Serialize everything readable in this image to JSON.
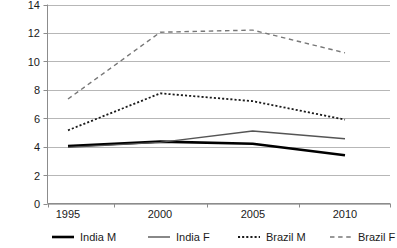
{
  "chart_data": {
    "type": "line",
    "title": "",
    "xlabel": "",
    "ylabel": "",
    "categories": [
      "1995",
      "2000",
      "2005",
      "2010"
    ],
    "x": [
      1995,
      2000,
      2005,
      2010
    ],
    "xlim": [
      1995,
      2010
    ],
    "ylim": [
      0,
      14
    ],
    "yticks": [
      "0",
      "2",
      "4",
      "6",
      "8",
      "10",
      "12",
      "14"
    ],
    "ytick_values": [
      0,
      2,
      4,
      6,
      8,
      10,
      12,
      14
    ],
    "grid": "horizontal",
    "legend_position": "bottom",
    "series": [
      {
        "name": "India M",
        "values": [
          4.05,
          4.35,
          4.2,
          3.4
        ],
        "style": "solid",
        "color": "#000000",
        "width": 2.6
      },
      {
        "name": "India F",
        "values": [
          3.95,
          4.3,
          5.1,
          4.55
        ],
        "style": "solid",
        "color": "#555555",
        "width": 1.4
      },
      {
        "name": "Brazil M",
        "values": [
          5.15,
          7.75,
          7.2,
          5.9
        ],
        "style": "dotted",
        "color": "#1a1a1a",
        "width": 1.8
      },
      {
        "name": "Brazil F",
        "values": [
          7.35,
          12.05,
          12.2,
          10.6
        ],
        "style": "dashed",
        "color": "#777777",
        "width": 1.4
      }
    ]
  },
  "axis": {
    "y_tick_0": "0",
    "y_tick_1": "2",
    "y_tick_2": "4",
    "y_tick_3": "6",
    "y_tick_4": "8",
    "y_tick_5": "10",
    "y_tick_6": "12",
    "y_tick_7": "14",
    "x_tick_0": "1995",
    "x_tick_1": "2000",
    "x_tick_2": "2005",
    "x_tick_3": "2010"
  },
  "legend": {
    "items": [
      {
        "label": "India M"
      },
      {
        "label": "India F"
      },
      {
        "label": "Brazil M"
      },
      {
        "label": "Brazil F"
      }
    ]
  },
  "colors": {
    "gridline": "#b7b7b7",
    "axis": "#8c8c8c",
    "india_m": "#000000",
    "india_f": "#555555",
    "brazil_m": "#1a1a1a",
    "brazil_f": "#777777",
    "background": "#ffffff"
  }
}
